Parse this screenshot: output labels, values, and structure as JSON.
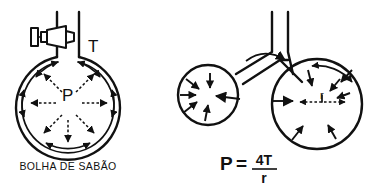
{
  "figure": {
    "background_color": "#ffffff",
    "ink_color": "#111111",
    "width": 378,
    "height": 188
  },
  "left_panel": {
    "caption": "BOLHA DE SABÃO",
    "tension_label": "T",
    "pressure_label": "P",
    "description": "Bolha de sabao inflada por um canudo com grampo; setas tracejadas radiais indicam a pressao interna P e setas curvas na parede indicam a tensao superficial T.",
    "bubble": {
      "center_x": 68,
      "center_y": 103,
      "outer_radius": 52,
      "inner_radius": 47
    },
    "straw": {
      "left_x": 57,
      "right_x": 79,
      "top_y": 12,
      "bottom_y": 58
    },
    "clamp": {
      "name": "tube-clamp",
      "x": 27,
      "y": 28,
      "width": 42,
      "height": 18
    },
    "pressure_arrows_count": 6,
    "tension_arcs_count": 6
  },
  "right_panel": {
    "formula": {
      "lhs": "P",
      "equals": "=",
      "numerator": "4T",
      "denominator": "r",
      "full": "P = 4T / r"
    },
    "radius_label": "r",
    "description": "Duas bolhas de tamanhos diferentes ligadas por um tubo em Y; a bolha menor esvazia na maior pois sua pressao interna e maior.",
    "small_bubble": {
      "name": "small-bubble",
      "center_x": 208,
      "center_y": 95,
      "radius": 30,
      "arrow_count": 6
    },
    "large_bubble": {
      "name": "large-bubble",
      "center_x": 317,
      "center_y": 104,
      "radius": 45,
      "arrow_count": 7
    },
    "tube": {
      "name": "y-tube",
      "stem_left_x": 272,
      "stem_right_x": 288,
      "stem_top_y": 12,
      "junction_y": 52
    },
    "flow_arrow": {
      "name": "air-flow-arrow",
      "direction": "small-to-large"
    }
  }
}
